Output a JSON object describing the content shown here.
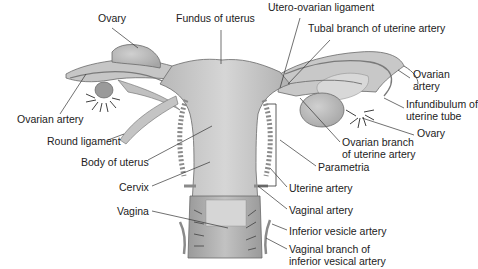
{
  "figure": {
    "labels": [
      {
        "id": "ovary-left",
        "text": "Ovary",
        "x": 98,
        "y": 18
      },
      {
        "id": "fundus",
        "text": "Fundus of uterus",
        "x": 176,
        "y": 18
      },
      {
        "id": "utero-ovarian-ligament",
        "text": "Utero-ovarian ligament",
        "x": 268,
        "y": 6
      },
      {
        "id": "tubal-branch",
        "text": "Tubal branch of uterine artery",
        "x": 308,
        "y": 28
      },
      {
        "id": "ovarian-artery-right",
        "text": "Ovarian\nartery",
        "x": 413,
        "y": 74
      },
      {
        "id": "ovarian-artery-left",
        "text": "Ovarian artery",
        "x": 17,
        "y": 114
      },
      {
        "id": "infundibulum",
        "text": "Infundibulum of\nuterine tube",
        "x": 406,
        "y": 103
      },
      {
        "id": "ovary-right",
        "text": "Ovary",
        "x": 417,
        "y": 131
      },
      {
        "id": "round-ligament",
        "text": "Round ligament",
        "x": 47,
        "y": 138
      },
      {
        "id": "ovarian-branch",
        "text": "Ovarian branch\nof uterine artery",
        "x": 342,
        "y": 137
      },
      {
        "id": "body-of-uterus",
        "text": "Body of uterus",
        "x": 81,
        "y": 155
      },
      {
        "id": "parametria",
        "text": "Parametria",
        "x": 318,
        "y": 162
      },
      {
        "id": "cervix",
        "text": "Cervix",
        "x": 119,
        "y": 181
      },
      {
        "id": "uterine-artery",
        "text": "Uterine artery",
        "x": 289,
        "y": 182
      },
      {
        "id": "vagina",
        "text": "Vagina",
        "x": 117,
        "y": 205
      },
      {
        "id": "vaginal-artery",
        "text": "Vaginal artery",
        "x": 289,
        "y": 204
      },
      {
        "id": "inferior-vesicle-artery",
        "text": "Inferior vesicle artery",
        "x": 289,
        "y": 225
      },
      {
        "id": "vaginal-branch",
        "text": "Vaginal branch of\ninferior vesical artery",
        "x": 289,
        "y": 244
      }
    ]
  },
  "colors": {
    "tissue_light": "#cfcfcf",
    "tissue_mid": "#b5b5b5",
    "tissue_dark": "#8a8a8a",
    "outline": "#6a6a6a",
    "vessel": "#7a7a7a",
    "leader": "#333333",
    "fimbria": "#2a2a2a"
  }
}
